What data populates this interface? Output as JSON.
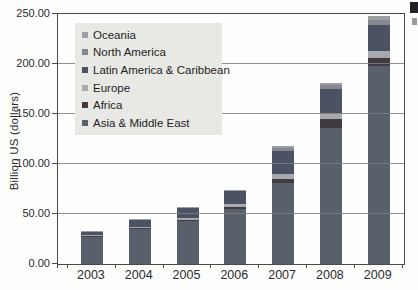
{
  "figure": {
    "background": "#fdfdfc",
    "frame_color": "#4a4a4a",
    "gridline_color": "#7e7e7e",
    "legend_background": "#e8e8e5",
    "text_color": "#2b2b2b",
    "edge_artifacts": [
      "cropped-text-fragment-dark",
      "cropped-text-fragment-light"
    ]
  },
  "chart_data": {
    "type": "bar",
    "stacked": true,
    "title": "",
    "xlabel": "",
    "ylabel": "Billion US (dollars)",
    "ylim": [
      0,
      250
    ],
    "ytick_step": 50,
    "ytick_labels": [
      "0.00",
      "50.00",
      "100.00",
      "150.00",
      "200.00",
      "250.00"
    ],
    "grid": "horizontal",
    "legend_position": "upper-left-inside",
    "legend_order_top_to_bottom": [
      "Oceania",
      "North America",
      "Latin America & Caribbean",
      "Europe",
      "Africa",
      "Asia & Middle East"
    ],
    "categories": [
      "2003",
      "2004",
      "2005",
      "2006",
      "2007",
      "2008",
      "2009"
    ],
    "series": [
      {
        "name": "Asia & Middle East",
        "color": "#58606c",
        "values": [
          27,
          35,
          43,
          55,
          81,
          136,
          198
        ]
      },
      {
        "name": "Africa",
        "color": "#413a43",
        "values": [
          0.8,
          1,
          1.5,
          2.5,
          4,
          9,
          8
        ]
      },
      {
        "name": "Europe",
        "color": "#a6aaac",
        "values": [
          1,
          1.2,
          2,
          3,
          5,
          6,
          7
        ]
      },
      {
        "name": "Latin America & Caribbean",
        "color": "#4b5263",
        "values": [
          3.7,
          7,
          9.5,
          12.5,
          23,
          24,
          26
        ]
      },
      {
        "name": "North America",
        "color": "#84898e",
        "values": [
          0.3,
          0.5,
          0.6,
          0.6,
          3,
          4,
          5
        ]
      },
      {
        "name": "Oceania",
        "color": "#9aa0a3",
        "values": [
          0.2,
          0.3,
          0.4,
          0.4,
          2,
          2,
          4
        ]
      }
    ],
    "totals": [
      33,
      45,
      57,
      74,
      118,
      181,
      248
    ]
  }
}
